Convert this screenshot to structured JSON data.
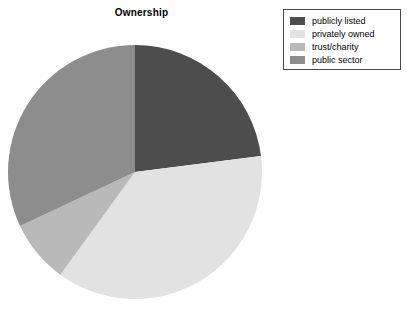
{
  "chart_data": {
    "type": "pie",
    "title": "Ownership",
    "xlabel": "",
    "ylabel": "",
    "legend_position": "top-right",
    "grid": false,
    "start_angle_deg": 90,
    "direction": "clockwise",
    "categories": [
      "publicly listed",
      "privately owned",
      "trust/charity",
      "public sector"
    ],
    "values": [
      23,
      37,
      8,
      32
    ],
    "colors": [
      "#4d4d4d",
      "#e2e2e2",
      "#b9b9b9",
      "#8d8d8d"
    ],
    "slices": [
      {
        "label": "publicly listed",
        "value": 23,
        "color": "#4d4d4d"
      },
      {
        "label": "privately owned",
        "value": 37,
        "color": "#e2e2e2"
      },
      {
        "label": "trust/charity",
        "value": 8,
        "color": "#b9b9b9"
      },
      {
        "label": "public sector",
        "value": 32,
        "color": "#8d8d8d"
      }
    ]
  },
  "chart": {
    "title": "Ownership",
    "geometry": {
      "cx": 128,
      "cy": 128,
      "r": 127
    }
  },
  "legend": {
    "items": [
      {
        "label": "publicly listed",
        "color": "#4d4d4d"
      },
      {
        "label": "privately owned",
        "color": "#e2e2e2"
      },
      {
        "label": "trust/charity",
        "color": "#b9b9b9"
      },
      {
        "label": "public sector",
        "color": "#8d8d8d"
      }
    ],
    "border_color": "#4a4a4a"
  },
  "page": {
    "background": "#ffffff"
  }
}
